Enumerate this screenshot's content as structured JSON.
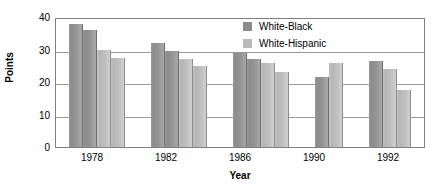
{
  "chart_data": {
    "type": "bar",
    "title": "",
    "xlabel": "Year",
    "ylabel": "Points",
    "ylim": [
      0,
      40
    ],
    "yticks": [
      0,
      10,
      20,
      30,
      40
    ],
    "grid": true,
    "legend_position": "top-right",
    "categories": [
      "1978",
      "1982",
      "1986",
      "1990",
      "1992"
    ],
    "legend": [
      "White-Black",
      "White-Hispanic"
    ],
    "groups": [
      {
        "category": "1978",
        "bars": [
          {
            "value": 38,
            "series": "White-Black",
            "shade": "dark"
          },
          {
            "value": 36,
            "series": "White-Black",
            "shade": "dark"
          },
          {
            "value": 30,
            "series": "White-Hispanic",
            "shade": "light"
          },
          {
            "value": 27.5,
            "series": "White-Hispanic",
            "shade": "light"
          }
        ]
      },
      {
        "category": "1982",
        "bars": [
          {
            "value": 32,
            "series": "White-Black",
            "shade": "dark"
          },
          {
            "value": 29.5,
            "series": "White-Black",
            "shade": "dark"
          },
          {
            "value": 27,
            "series": "White-Hispanic",
            "shade": "light"
          },
          {
            "value": 25,
            "series": "White-Hispanic",
            "shade": "light"
          }
        ]
      },
      {
        "category": "1986",
        "bars": [
          {
            "value": 29,
            "series": "White-Black",
            "shade": "dark"
          },
          {
            "value": 27,
            "series": "White-Black",
            "shade": "dark"
          },
          {
            "value": 26,
            "series": "White-Hispanic",
            "shade": "light"
          },
          {
            "value": 23,
            "series": "White-Hispanic",
            "shade": "light"
          }
        ]
      },
      {
        "category": "1990",
        "bars": [
          {
            "value": 21.5,
            "series": "White-Black",
            "shade": "dark"
          },
          {
            "value": 26,
            "series": "White-Hispanic",
            "shade": "light"
          }
        ]
      },
      {
        "category": "1992",
        "bars": [
          {
            "value": 26.5,
            "series": "White-Black",
            "shade": "dark"
          },
          {
            "value": 24,
            "series": "White-Hispanic",
            "shade": "light"
          },
          {
            "value": 17.5,
            "series": "White-Hispanic",
            "shade": "light"
          }
        ]
      }
    ],
    "series": [
      {
        "name": "White-Black",
        "values": [
          38,
          32,
          29,
          21.5,
          26.5
        ]
      },
      {
        "name": "White-Hispanic",
        "values": [
          30,
          27,
          26,
          26,
          24
        ]
      }
    ],
    "colors": {
      "series_white_black": "#8c8c8c",
      "series_white_hispanic": "#b9b9b9",
      "gridline": "#9a9a9a",
      "frame": "#808080",
      "text": "#000000",
      "background": "#ffffff"
    }
  }
}
